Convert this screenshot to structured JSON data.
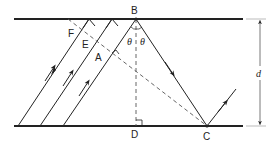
{
  "diagram": {
    "type": "ray-reflection-geometry",
    "points": {
      "B": "B",
      "F": "F",
      "E": "E",
      "A": "A",
      "D": "D",
      "C": "C"
    },
    "angle_symbol": "θ",
    "distance_label": "d",
    "colors": {
      "line": "#222222",
      "dashed": "#555555",
      "extension": "#aaaaaa"
    },
    "elements": [
      "top boundary line",
      "bottom boundary line",
      "three parallel incident rays",
      "dashed wavefront line through F, E, A to C",
      "dashed normal B to D",
      "reflected ray B to C",
      "outgoing ray from C",
      "distance marker d"
    ]
  }
}
